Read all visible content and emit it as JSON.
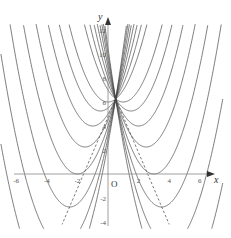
{
  "chart_data": {
    "type": "line",
    "title": "",
    "xlabel": "x",
    "ylabel": "y",
    "origin_label": "O",
    "xlim": [
      -6.5,
      7
    ],
    "ylim": [
      -4.5,
      12.5
    ],
    "x_ticks": [
      -6,
      -4,
      -2,
      2,
      4,
      6
    ],
    "y_ticks": [
      -4,
      -2,
      2,
      4,
      6,
      8,
      10,
      12
    ],
    "grid": false,
    "common_point": [
      0.5,
      6.25
    ],
    "series": [
      {
        "name": "h=-3.5",
        "vertex": [
          -3.5,
          -9.75
        ]
      },
      {
        "name": "h=-3",
        "vertex": [
          -3,
          -6
        ]
      },
      {
        "name": "h=-2.5",
        "vertex": [
          -2.5,
          -2.75
        ]
      },
      {
        "name": "h=-2",
        "vertex": [
          -2,
          0
        ]
      },
      {
        "name": "h=-1.5",
        "vertex": [
          -1.5,
          2.25
        ]
      },
      {
        "name": "h=-1",
        "vertex": [
          -1,
          4
        ]
      },
      {
        "name": "h=-0.5",
        "vertex": [
          -0.5,
          5.25
        ]
      },
      {
        "name": "h=0",
        "vertex": [
          0,
          6
        ]
      },
      {
        "name": "h=1",
        "vertex": [
          1,
          6
        ]
      },
      {
        "name": "h=1.5",
        "vertex": [
          1.5,
          5.25
        ]
      },
      {
        "name": "h=2",
        "vertex": [
          2,
          4
        ]
      },
      {
        "name": "h=2.5",
        "vertex": [
          2.5,
          2.25
        ]
      },
      {
        "name": "h=3",
        "vertex": [
          3,
          0
        ]
      },
      {
        "name": "h=3.5",
        "vertex": [
          3.5,
          -2.75
        ]
      },
      {
        "name": "h=4",
        "vertex": [
          4,
          -6
        ]
      },
      {
        "name": "h=4.5",
        "vertex": [
          4.5,
          -9.75
        ]
      }
    ],
    "h_values": [
      -3.5,
      -3,
      -2.5,
      -2,
      -1.5,
      -1,
      -0.5,
      0,
      1,
      1.5,
      2,
      2.5,
      3,
      3.5,
      4,
      4.5
    ],
    "dashed_lines": [
      {
        "from": [
          0.5,
          6.25
        ],
        "to": [
          -3.0,
          -4.2
        ]
      },
      {
        "from": [
          0.5,
          6.25
        ],
        "to": [
          4.0,
          -4.2
        ]
      }
    ]
  }
}
